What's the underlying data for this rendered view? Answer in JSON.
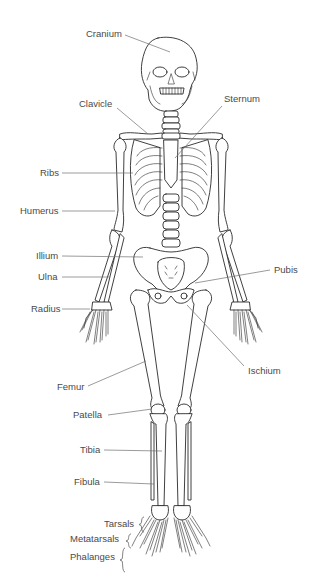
{
  "diagram": {
    "labels": [
      {
        "id": "cranium",
        "text": "Cranium",
        "x": 86,
        "y": 37,
        "anchor": "start",
        "line": [
          125,
          35,
          170,
          52
        ]
      },
      {
        "id": "clavicle",
        "text": "Clavicle",
        "x": 79,
        "y": 107,
        "anchor": "start",
        "line": [
          117,
          108,
          148,
          134
        ]
      },
      {
        "id": "sternum",
        "text": "Sternum",
        "x": 224,
        "y": 102,
        "anchor": "start",
        "line": [
          222,
          106,
          175,
          158
        ]
      },
      {
        "id": "ribs",
        "text": "Ribs",
        "x": 40,
        "y": 176,
        "anchor": "start",
        "line": [
          62,
          173,
          133,
          173
        ]
      },
      {
        "id": "humerus",
        "text": "Humerus",
        "x": 20,
        "y": 214,
        "anchor": "start",
        "line": [
          62,
          211,
          115,
          211
        ]
      },
      {
        "id": "illium",
        "text": "Illium",
        "x": 36,
        "y": 259,
        "anchor": "start",
        "line": [
          62,
          256,
          143,
          257
        ]
      },
      {
        "id": "ulna",
        "text": "Ulna",
        "x": 38,
        "y": 280,
        "anchor": "start",
        "line": [
          62,
          277,
          110,
          277
        ]
      },
      {
        "id": "pubis",
        "text": "Pubis",
        "x": 274,
        "y": 273,
        "anchor": "start",
        "line": [
          270,
          270,
          195,
          283
        ]
      },
      {
        "id": "radius",
        "text": "Radius",
        "x": 31,
        "y": 312,
        "anchor": "start",
        "line": [
          62,
          309,
          90,
          309
        ]
      },
      {
        "id": "ischium",
        "text": "Ischium",
        "x": 248,
        "y": 374,
        "anchor": "start",
        "line": [
          244,
          366,
          187,
          305
        ]
      },
      {
        "id": "femur",
        "text": "Femur",
        "x": 57,
        "y": 390,
        "anchor": "start",
        "line": [
          88,
          386,
          146,
          361
        ]
      },
      {
        "id": "patella",
        "text": "Patella",
        "x": 73,
        "y": 418,
        "anchor": "start",
        "line": [
          108,
          415,
          152,
          409
        ]
      },
      {
        "id": "tibia",
        "text": "Tibia",
        "x": 80,
        "y": 453,
        "anchor": "start",
        "line": [
          104,
          450,
          162,
          451
        ]
      },
      {
        "id": "fibula",
        "text": "Fibula",
        "x": 74,
        "y": 485,
        "anchor": "start",
        "line": [
          104,
          482,
          154,
          484
        ]
      },
      {
        "id": "tarsals",
        "text": "Tarsals",
        "x": 104,
        "y": 527,
        "anchor": "start",
        "brace": [
          141,
          517,
          141,
          532
        ]
      },
      {
        "id": "metatarsals",
        "text": "Metatarsals",
        "x": 70,
        "y": 542,
        "anchor": "start",
        "brace": [
          128,
          534,
          128,
          548
        ]
      },
      {
        "id": "phalanges",
        "text": "Phalanges",
        "x": 70,
        "y": 560,
        "anchor": "start",
        "brace": [
          122,
          548,
          122,
          572
        ]
      }
    ]
  }
}
